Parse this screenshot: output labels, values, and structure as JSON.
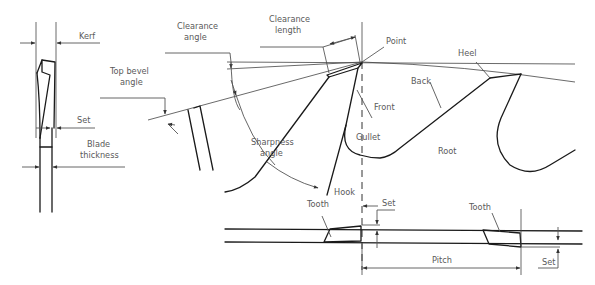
{
  "diagram": {
    "labels": {
      "kerf": "Kerf",
      "set_side": "Set",
      "blade_thickness_line1": "Blade",
      "blade_thickness_line2": "thickness",
      "top_bevel_line1": "Top bevel",
      "top_bevel_line2": "angle",
      "clearance_angle_line1": "Clearance",
      "clearance_angle_line2": "angle",
      "clearance_length_line1": "Clearance",
      "clearance_length_line2": "length",
      "point": "Point",
      "heel": "Heel",
      "back": "Back",
      "front": "Front",
      "gullet": "Gullet",
      "root": "Root",
      "sharpness_line1": "Sharpness",
      "sharpness_line2": "angle",
      "hook": "Hook",
      "tooth_left": "Tooth",
      "tooth_right": "Tooth",
      "set_top": "Set",
      "pitch": "Pitch",
      "set_bottom": "Set"
    }
  }
}
